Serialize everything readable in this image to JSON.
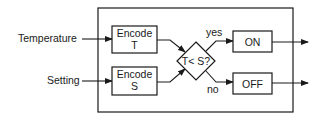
{
  "diagram": {
    "type": "block-flow",
    "inputs": [
      {
        "id": "temperature",
        "label": "Temperature"
      },
      {
        "id": "setting",
        "label": "Setting"
      }
    ],
    "blocks": [
      {
        "id": "encode_t",
        "line1": "Encode",
        "line2": "T"
      },
      {
        "id": "encode_s",
        "line1": "Encode",
        "line2": "S"
      }
    ],
    "decision": {
      "id": "compare",
      "label": "T< S?"
    },
    "branches": [
      {
        "label": "yes",
        "target": "on"
      },
      {
        "label": "no",
        "target": "off"
      }
    ],
    "outputs": [
      {
        "id": "on",
        "label": "ON"
      },
      {
        "id": "off",
        "label": "OFF"
      }
    ],
    "colors": {
      "stroke": "#1a1a1a",
      "background": "#ffffff"
    }
  }
}
